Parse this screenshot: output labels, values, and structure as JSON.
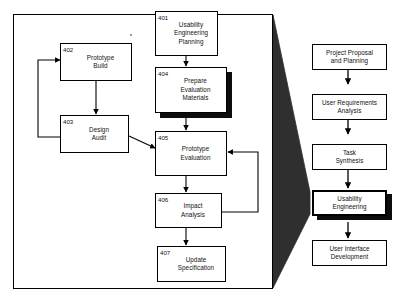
{
  "figure": {
    "background_color": "#ffffff",
    "line_color": "#000000",
    "shadow_color": "#0d0d0d"
  },
  "detail_panel": {
    "name": "usability-engineering-detail-frame",
    "nodes": [
      {
        "id": "n401",
        "ref": "401",
        "label": "Usability\nEngineering\nPlanning",
        "emphasized": false,
        "shadow": false
      },
      {
        "id": "n402",
        "ref": "402",
        "label": "Prototype\nBuild",
        "emphasized": false,
        "shadow": false
      },
      {
        "id": "n403",
        "ref": "403",
        "label": "Design\nAudit",
        "emphasized": false,
        "shadow": false
      },
      {
        "id": "n404",
        "ref": "404",
        "label": "Prepare\nEvaluation\nMaterials",
        "emphasized": false,
        "shadow": true
      },
      {
        "id": "n405",
        "ref": "405",
        "label": "Prototype\nEvaluation",
        "emphasized": false,
        "shadow": false
      },
      {
        "id": "n406",
        "ref": "406",
        "label": "Impact\nAnalysis",
        "emphasized": false,
        "shadow": false
      },
      {
        "id": "n407",
        "ref": "407",
        "label": "Update\nSpecification",
        "emphasized": false,
        "shadow": false
      }
    ],
    "connections": [
      {
        "from": "401",
        "to": "404",
        "style": "straight-down-arrow"
      },
      {
        "from": "404",
        "to": "405",
        "style": "straight-down-arrow"
      },
      {
        "from": "402",
        "to": "403",
        "style": "straight-down-arrow"
      },
      {
        "from": "403",
        "to": "402",
        "style": "feedback-loop-left-up"
      },
      {
        "from": "403",
        "to": "405",
        "style": "diagonal-arrow"
      },
      {
        "from": "405",
        "to": "406",
        "style": "straight-down-arrow"
      },
      {
        "from": "406",
        "to": "405",
        "style": "feedback-loop-right-up"
      },
      {
        "from": "406",
        "to": "407",
        "style": "straight-down-arrow"
      }
    ]
  },
  "process_column": {
    "name": "lifecycle-process-column",
    "nodes": [
      {
        "id": "p1",
        "label": "Project Proposal\nand Planning",
        "emphasized": false,
        "shadow": false
      },
      {
        "id": "p2",
        "label": "User Requirements\nAnalysis",
        "emphasized": false,
        "shadow": false
      },
      {
        "id": "p3",
        "label": "Task\nSynthesis",
        "emphasized": false,
        "shadow": false
      },
      {
        "id": "p4",
        "label": "Usability\nEngineering",
        "emphasized": true,
        "shadow": true
      },
      {
        "id": "p5",
        "label": "User Interface\nDevelopment",
        "emphasized": false,
        "shadow": false
      }
    ],
    "connections": [
      {
        "from": "p1",
        "to": "p2",
        "style": "straight-down-arrow"
      },
      {
        "from": "p2",
        "to": "p3",
        "style": "straight-down-arrow"
      },
      {
        "from": "p3",
        "to": "p4",
        "style": "straight-down-arrow"
      },
      {
        "from": "p4",
        "to": "p5",
        "style": "straight-down-arrow"
      }
    ]
  },
  "callout_wedge": {
    "name": "expansion-callout-wedge",
    "from": "Usability Engineering",
    "to": "detail panel",
    "fill": "#2e2e2e"
  }
}
